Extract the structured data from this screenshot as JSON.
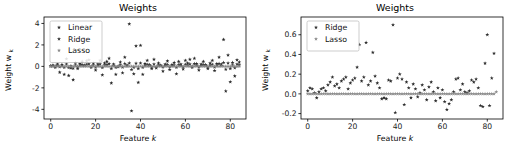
{
  "figure": {
    "background_color": "#ffffff",
    "panels": [
      "left",
      "right"
    ]
  },
  "chart_data": [
    {
      "id": "left",
      "type": "scatter",
      "title": "Weights",
      "xlabel": "Feature k",
      "ylabel": "Weight w",
      "ylabel_sub": "k",
      "xlabel_plain": "Feature",
      "xlabel_ital": "k",
      "xlim": [
        -3,
        87
      ],
      "ylim": [
        -4.9,
        4.6
      ],
      "xticks": [
        0,
        20,
        40,
        60,
        80
      ],
      "xtick_labels": [
        "0",
        "20",
        "40",
        "60",
        "80"
      ],
      "yticks": [
        -4,
        -2,
        0,
        2,
        4
      ],
      "ytick_labels": [
        "-4",
        "-2",
        "0",
        "2",
        "4"
      ],
      "grid": false,
      "legend_position": "upper-left",
      "marker": "star",
      "series": [
        {
          "name": "Linear",
          "color": "#2b2b2b",
          "x": [
            0,
            1,
            2,
            3,
            4,
            5,
            6,
            7,
            8,
            9,
            10,
            11,
            12,
            13,
            14,
            15,
            16,
            17,
            18,
            19,
            20,
            21,
            22,
            23,
            24,
            25,
            26,
            27,
            28,
            29,
            30,
            31,
            32,
            33,
            34,
            35,
            36,
            37,
            38,
            39,
            40,
            41,
            42,
            43,
            44,
            45,
            46,
            47,
            48,
            49,
            50,
            51,
            52,
            53,
            54,
            55,
            56,
            57,
            58,
            59,
            60,
            61,
            62,
            63,
            64,
            65,
            66,
            67,
            68,
            69,
            70,
            71,
            72,
            73,
            74,
            75,
            76,
            77,
            78,
            79,
            80,
            81,
            82,
            83,
            84
          ],
          "values": [
            0.05,
            0.1,
            -0.1,
            0.2,
            -0.55,
            0.15,
            -0.75,
            0.7,
            -0.85,
            -0.15,
            -1.25,
            0.35,
            -0.2,
            0.25,
            0.45,
            0.1,
            0.5,
            0.6,
            -0.1,
            0.3,
            -0.35,
            0.2,
            0.55,
            -0.8,
            0.3,
            0.45,
            0.75,
            -1.55,
            0.2,
            -0.75,
            -0.05,
            0.4,
            -0.6,
            0.85,
            0.1,
            3.95,
            -4.15,
            -0.7,
            1.9,
            -1.5,
            1.95,
            -0.75,
            0.25,
            0.55,
            0.15,
            -0.2,
            0.65,
            -0.15,
            0.3,
            0.1,
            -0.45,
            0.2,
            0.5,
            -0.3,
            0.15,
            0.35,
            -0.7,
            0.45,
            0.2,
            -0.25,
            0.55,
            0.3,
            0.65,
            -0.1,
            0.75,
            0.25,
            -0.35,
            0.2,
            0.45,
            0.15,
            -0.2,
            0.3,
            0.55,
            -0.4,
            0.25,
            0.85,
            0.2,
            2.5,
            -2.3,
            1.05,
            -1.45,
            0.35,
            -0.9,
            0.6,
            0.4
          ]
        },
        {
          "name": "Ridge",
          "color": "#333333",
          "x": [
            0,
            1,
            2,
            3,
            4,
            5,
            6,
            7,
            8,
            9,
            10,
            11,
            12,
            13,
            14,
            15,
            16,
            17,
            18,
            19,
            20,
            21,
            22,
            23,
            24,
            25,
            26,
            27,
            28,
            29,
            30,
            31,
            32,
            33,
            34,
            35,
            36,
            37,
            38,
            39,
            40,
            41,
            42,
            43,
            44,
            45,
            46,
            47,
            48,
            49,
            50,
            51,
            52,
            53,
            54,
            55,
            56,
            57,
            58,
            59,
            60,
            61,
            62,
            63,
            64,
            65,
            66,
            67,
            68,
            69,
            70,
            71,
            72,
            73,
            74,
            75,
            76,
            77,
            78,
            79,
            80,
            81,
            82,
            83,
            84
          ],
          "values": [
            0.02,
            0.05,
            0.0,
            0.1,
            -0.05,
            0.08,
            -0.1,
            0.2,
            -0.12,
            0.03,
            -0.18,
            0.12,
            -0.04,
            0.1,
            0.15,
            0.05,
            0.18,
            0.22,
            0.0,
            0.12,
            -0.08,
            0.09,
            0.2,
            -0.12,
            0.11,
            0.16,
            0.24,
            -0.2,
            0.08,
            -0.1,
            0.0,
            0.14,
            -0.08,
            0.26,
            0.04,
            0.3,
            -0.3,
            -0.1,
            0.28,
            -0.2,
            0.3,
            -0.1,
            0.09,
            0.18,
            0.06,
            -0.04,
            0.2,
            -0.05,
            0.1,
            0.04,
            -0.07,
            0.08,
            0.16,
            -0.05,
            0.06,
            0.12,
            -0.1,
            0.15,
            0.07,
            -0.05,
            0.18,
            0.1,
            0.21,
            0.0,
            0.24,
            0.09,
            -0.06,
            0.07,
            0.15,
            0.05,
            -0.04,
            0.1,
            0.18,
            -0.07,
            0.09,
            0.26,
            0.07,
            0.35,
            -0.28,
            0.3,
            -0.2,
            0.12,
            -0.14,
            0.2,
            0.14
          ]
        },
        {
          "name": "Lasso",
          "color": "#888888",
          "x": [
            0,
            1,
            2,
            3,
            4,
            5,
            6,
            7,
            8,
            9,
            10,
            11,
            12,
            13,
            14,
            15,
            16,
            17,
            18,
            19,
            20,
            21,
            22,
            23,
            24,
            25,
            26,
            27,
            28,
            29,
            30,
            31,
            32,
            33,
            34,
            35,
            36,
            37,
            38,
            39,
            40,
            41,
            42,
            43,
            44,
            45,
            46,
            47,
            48,
            49,
            50,
            51,
            52,
            53,
            54,
            55,
            56,
            57,
            58,
            59,
            60,
            61,
            62,
            63,
            64,
            65,
            66,
            67,
            68,
            69,
            70,
            71,
            72,
            73,
            74,
            75,
            76,
            77,
            78,
            79,
            80,
            81,
            82,
            83,
            84
          ],
          "values": [
            0,
            0,
            0,
            0,
            0,
            0,
            0,
            0,
            0,
            0,
            0,
            0,
            0,
            0,
            0,
            0,
            0,
            0,
            0,
            0,
            0,
            0,
            0,
            0,
            0,
            0,
            0,
            0,
            0,
            0,
            0,
            0,
            0,
            0,
            0,
            0,
            0,
            0,
            0,
            0,
            0,
            0,
            0,
            0,
            0,
            0,
            0,
            0,
            0,
            0,
            0,
            0,
            0,
            0,
            0,
            0,
            0,
            0,
            0,
            0,
            0,
            0,
            0,
            0,
            0,
            0,
            0,
            0,
            0,
            0,
            0,
            0,
            0,
            0,
            0,
            0,
            0,
            0,
            0,
            0,
            0,
            0,
            0,
            0,
            0
          ]
        }
      ]
    },
    {
      "id": "right",
      "type": "scatter",
      "title": "Weights",
      "xlabel": "Feature k",
      "ylabel": "Weight w",
      "ylabel_sub": "k",
      "xlabel_plain": "Feature",
      "xlabel_ital": "k",
      "xlim": [
        -3,
        87
      ],
      "ylim": [
        -0.255,
        0.78
      ],
      "xticks": [
        0,
        20,
        40,
        60,
        80
      ],
      "xtick_labels": [
        "0",
        "20",
        "40",
        "60",
        "80"
      ],
      "yticks": [
        -0.2,
        0.0,
        0.2,
        0.4,
        0.6
      ],
      "ytick_labels": [
        "-0.2",
        "0.0",
        "0.2",
        "0.4",
        "0.6"
      ],
      "grid": false,
      "legend_position": "upper-left",
      "marker": "star",
      "series": [
        {
          "name": "Ridge",
          "color": "#2f2f2f",
          "x": [
            0,
            1,
            2,
            3,
            4,
            5,
            6,
            7,
            8,
            9,
            10,
            11,
            12,
            13,
            14,
            15,
            16,
            17,
            18,
            19,
            20,
            21,
            22,
            23,
            24,
            25,
            26,
            27,
            28,
            29,
            30,
            31,
            32,
            33,
            34,
            35,
            36,
            37,
            38,
            39,
            40,
            41,
            42,
            43,
            44,
            45,
            46,
            47,
            48,
            49,
            50,
            51,
            52,
            53,
            54,
            55,
            56,
            57,
            58,
            59,
            60,
            61,
            62,
            63,
            64,
            65,
            66,
            67,
            68,
            69,
            70,
            71,
            72,
            73,
            74,
            75,
            76,
            77,
            78,
            79,
            80,
            81,
            82,
            83,
            84
          ],
          "values": [
            0.03,
            0.06,
            0.05,
            0.01,
            -0.04,
            0.02,
            0.05,
            0.06,
            0.03,
            0.09,
            0.12,
            0.17,
            0.08,
            0.1,
            0.06,
            0.13,
            0.15,
            0.17,
            0.05,
            0.11,
            0.14,
            0.16,
            0.27,
            0.5,
            0.13,
            0.17,
            0.52,
            0.09,
            0.13,
            0.42,
            0.18,
            0.11,
            0.06,
            -0.05,
            -0.04,
            -0.05,
            0.14,
            0.13,
            0.7,
            -0.19,
            0.16,
            0.2,
            0.15,
            -0.11,
            0.12,
            0.06,
            -0.04,
            0.1,
            0.05,
            -0.03,
            0.01,
            0.09,
            0.04,
            -0.06,
            0.07,
            0.12,
            0.02,
            -0.07,
            0.06,
            -0.04,
            0.04,
            -0.08,
            -0.16,
            -0.1,
            -0.06,
            0.02,
            0.15,
            0.16,
            0.04,
            0.1,
            0.02,
            0.01,
            0.03,
            0.14,
            0.12,
            0.15,
            0.06,
            -0.12,
            -0.13,
            0.31,
            0.6,
            -0.12,
            0.16,
            0.41
          ]
        },
        {
          "name": "Lasso",
          "color": "#8a8a8a",
          "x": [
            0,
            1,
            2,
            3,
            4,
            5,
            6,
            7,
            8,
            9,
            10,
            11,
            12,
            13,
            14,
            15,
            16,
            17,
            18,
            19,
            20,
            21,
            22,
            23,
            24,
            25,
            26,
            27,
            28,
            29,
            30,
            31,
            32,
            33,
            34,
            35,
            36,
            37,
            38,
            39,
            40,
            41,
            42,
            43,
            44,
            45,
            46,
            47,
            48,
            49,
            50,
            51,
            52,
            53,
            54,
            55,
            56,
            57,
            58,
            59,
            60,
            61,
            62,
            63,
            64,
            65,
            66,
            67,
            68,
            69,
            70,
            71,
            72,
            73,
            74,
            75,
            76,
            77,
            78,
            79,
            80,
            81,
            82,
            83,
            84
          ],
          "values": [
            0,
            0,
            0,
            0,
            0,
            0,
            0,
            0,
            0,
            0,
            0,
            0,
            0,
            0,
            0,
            0,
            0,
            0,
            0,
            0,
            0,
            0,
            0,
            0,
            0,
            0,
            0,
            0,
            0,
            0,
            0,
            0,
            0,
            0,
            0,
            0,
            0,
            0,
            0,
            0,
            0,
            0,
            0,
            0,
            0,
            0,
            0,
            0,
            0,
            0,
            0,
            0,
            0,
            0,
            0,
            0,
            0,
            0,
            0,
            0,
            0,
            0,
            0,
            0,
            0,
            0,
            0,
            0,
            0,
            0,
            0,
            0,
            0,
            0,
            0,
            0,
            0,
            0,
            0,
            0,
            0,
            0,
            0,
            0,
            0.02
          ]
        }
      ]
    }
  ]
}
